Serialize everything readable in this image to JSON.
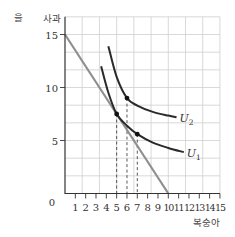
{
  "corner_label": "을",
  "chart_data": {
    "type": "line",
    "title": "",
    "xlabel": "복숭아",
    "ylabel": "사과",
    "xlim": [
      0,
      15
    ],
    "ylim": [
      0,
      16.67
    ],
    "x_ticks": [
      0,
      1,
      2,
      3,
      4,
      5,
      6,
      7,
      8,
      9,
      10,
      11,
      12,
      13,
      14,
      15
    ],
    "x_tick_labels": [
      "0",
      "1",
      "2",
      "3",
      "4",
      "5",
      "6",
      "7",
      "8",
      "9",
      "10",
      "11",
      "12",
      "13",
      "14",
      "15"
    ],
    "y_ticks": [
      5,
      10,
      15
    ],
    "y_tick_labels": [
      "5",
      "10",
      "15"
    ],
    "origin_label": "0",
    "grid": true,
    "series": [
      {
        "name": "budget_line",
        "style": "gray",
        "points": [
          [
            0,
            15
          ],
          [
            10,
            0
          ]
        ]
      },
      {
        "name": "U1",
        "label": "U",
        "label_sub": "1",
        "style": "black-curve",
        "points": [
          [
            3.5,
            12.0
          ],
          [
            4.2,
            9.5
          ],
          [
            5,
            7.5
          ],
          [
            6,
            6.4
          ],
          [
            7,
            5.6
          ],
          [
            8.5,
            4.8
          ],
          [
            10,
            4.3
          ],
          [
            11.5,
            3.9
          ]
        ]
      },
      {
        "name": "U2",
        "label": "U",
        "label_sub": "2",
        "style": "black-curve",
        "points": [
          [
            4.2,
            13.9
          ],
          [
            5,
            11.0
          ],
          [
            6,
            9.0
          ],
          [
            7,
            8.3
          ],
          [
            8.5,
            7.7
          ],
          [
            10,
            7.35
          ],
          [
            10.8,
            7.2
          ]
        ]
      }
    ],
    "marked_points": [
      {
        "x": 5,
        "y": 7.5,
        "on": "U1",
        "dashed_to_axis": true
      },
      {
        "x": 6,
        "y": 9.0,
        "on": "U2",
        "dashed_to_axis": true
      },
      {
        "x": 7,
        "y": 5.6,
        "on": "U1",
        "dashed_to_axis": true
      }
    ]
  }
}
